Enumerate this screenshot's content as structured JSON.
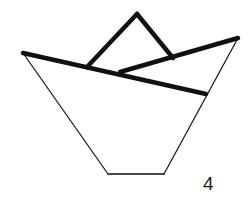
{
  "diagram": {
    "step_number": "4",
    "colors": {
      "background": "#ffffff",
      "stroke": "#111111"
    },
    "lines": {
      "thin_outline": [
        {
          "name": "left-side",
          "x1": 23,
          "y1": 53,
          "x2": 108,
          "y2": 174,
          "width": 1.2
        },
        {
          "name": "bottom",
          "x1": 108,
          "y1": 174,
          "x2": 164,
          "y2": 174,
          "width": 1.6
        },
        {
          "name": "right-side",
          "x1": 164,
          "y1": 174,
          "x2": 238,
          "y2": 38,
          "width": 1.2
        }
      ],
      "thick_folds": [
        {
          "name": "front-fold",
          "x1": 23,
          "y1": 53,
          "x2": 206,
          "y2": 94,
          "width": 4.5
        },
        {
          "name": "back-fold",
          "x1": 120,
          "y1": 72,
          "x2": 238,
          "y2": 38,
          "width": 4.5
        },
        {
          "name": "peak-left",
          "x1": 87,
          "y1": 67,
          "x2": 137,
          "y2": 14,
          "width": 4.5
        },
        {
          "name": "peak-right",
          "x1": 137,
          "y1": 14,
          "x2": 173,
          "y2": 58,
          "width": 4.5
        }
      ]
    }
  }
}
